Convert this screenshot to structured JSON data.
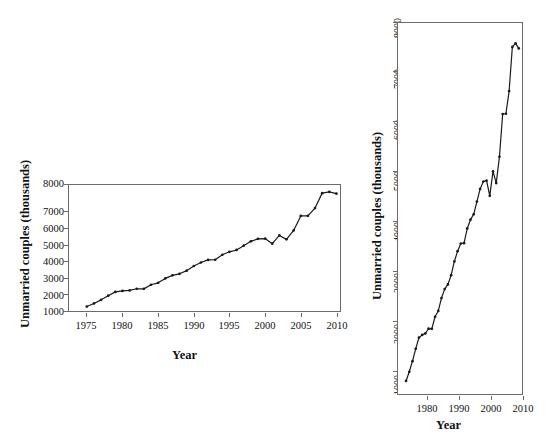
{
  "figure": {
    "background": "#ffffff",
    "line_color": "#1a1a1a",
    "axis_color": "#6b6b6b",
    "panel_count": 2
  },
  "panels": {
    "left": {
      "name": "landscape-aspect-panel",
      "xlabel": "Year",
      "ylabel": "Unmarried couples (thousands)",
      "xticks": [
        "1975",
        "1980",
        "1985",
        "1990",
        "1995",
        "2000",
        "2005",
        "2010"
      ],
      "yticks": [
        "1000",
        "2000",
        "3000",
        "4000",
        "5000",
        "6000",
        "7000",
        "8000"
      ]
    },
    "right": {
      "name": "tall-aspect-panel",
      "xlabel": "Year",
      "ylabel": "Unmarried couples (thousands)",
      "xticks": [
        "1980",
        "1990",
        "2000",
        "2010"
      ],
      "yticks": [
        "1000",
        "2000",
        "3000",
        "4000",
        "5000",
        "6000",
        "7000",
        "8000"
      ]
    }
  },
  "chart_data": {
    "type": "line",
    "title": "",
    "xlabel": "Year",
    "ylabel": "Unmarried couples (thousands)",
    "xlim": [
      1974.5,
      2012.5
    ],
    "ylim": [
      700,
      8000
    ],
    "grid": false,
    "legend": null,
    "marker": "filled-circle",
    "series": [
      {
        "name": "Unmarried couples (thousands)",
        "x": [
          1977,
          1978,
          1979,
          1980,
          1981,
          1982,
          1983,
          1984,
          1985,
          1986,
          1987,
          1988,
          1989,
          1990,
          1991,
          1992,
          1993,
          1994,
          1995,
          1996,
          1997,
          1998,
          1999,
          2000,
          2001,
          2002,
          2003,
          2004,
          2005,
          2006,
          2007,
          2008,
          2009,
          2010,
          2011,
          2012
        ],
        "y": [
          957,
          1137,
          1346,
          1589,
          1808,
          1863,
          1891,
          1988,
          1983,
          2220,
          2334,
          2588,
          2764,
          2856,
          3039,
          3308,
          3510,
          3661,
          3668,
          3958,
          4130,
          4236,
          4486,
          4736,
          4881,
          4898,
          4600,
          5080,
          4850,
          5368,
          6209,
          6214,
          6661,
          7529,
          7600,
          7500
        ]
      }
    ],
    "xlim_right_panel": [
      1974.5,
      2013
    ],
    "note": "Identical data rendered twice at different aspect ratios"
  }
}
